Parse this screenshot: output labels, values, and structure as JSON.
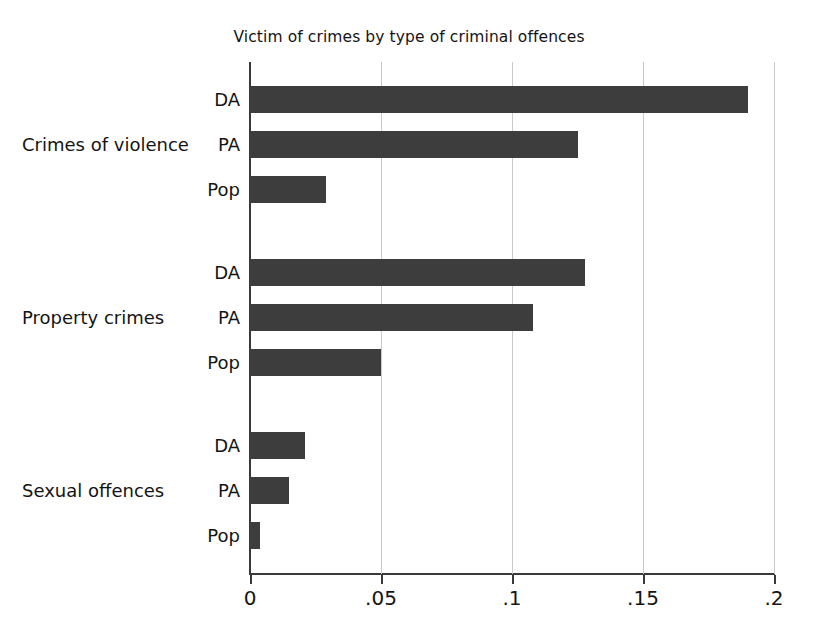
{
  "chart_data": {
    "type": "bar",
    "orientation": "horizontal",
    "title": "Victim of crimes by type of criminal offences",
    "xlabel": "",
    "ylabel": "",
    "xlim": [
      0,
      0.2
    ],
    "xticks": [
      0,
      0.05,
      0.1,
      0.15,
      0.2
    ],
    "xtick_labels": [
      "0",
      ".05",
      ".1",
      ".15",
      ".2"
    ],
    "grid": "vertical",
    "legend": "none",
    "bar_color": "#3d3d3d",
    "groups": [
      {
        "label": "Crimes of violence",
        "categories": [
          "DA",
          "PA",
          "Pop"
        ],
        "values": [
          0.19,
          0.125,
          0.029
        ]
      },
      {
        "label": "Property crimes",
        "categories": [
          "DA",
          "PA",
          "Pop"
        ],
        "values": [
          0.128,
          0.108,
          0.05
        ]
      },
      {
        "label": "Sexual offences",
        "categories": [
          "DA",
          "PA",
          "Pop"
        ],
        "values": [
          0.021,
          0.015,
          0.004
        ]
      }
    ]
  }
}
